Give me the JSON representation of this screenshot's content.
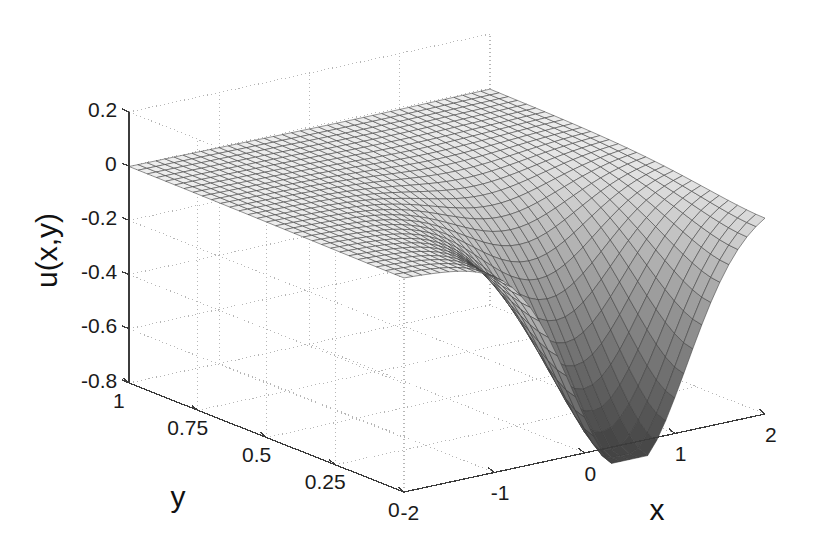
{
  "chart_data": {
    "type": "surface",
    "title": "",
    "xlabel": "x",
    "ylabel": "y",
    "zlabel": "u(x,y)",
    "xlim": [
      -2,
      2
    ],
    "ylim": [
      0,
      1
    ],
    "zlim": [
      -0.8,
      0.2
    ],
    "xticks": [
      "-2",
      "-1",
      "0",
      "1",
      "2"
    ],
    "xtick_values": [
      -2,
      -1,
      0,
      1,
      2
    ],
    "yticks": [
      "1",
      "0.75",
      "0.5",
      "0.25",
      "0"
    ],
    "ytick_values": [
      1,
      0.75,
      0.5,
      0.25,
      0
    ],
    "zticks": [
      "0.2",
      "0",
      "-0.2",
      "-0.4",
      "-0.6",
      "-0.8"
    ],
    "ztick_values": [
      0.2,
      0,
      -0.2,
      -0.4,
      -0.6,
      -0.8
    ],
    "grid": true,
    "legend": "none",
    "colormap": "gray",
    "shading": "faceted",
    "mesh_color": "#3c3c3c",
    "grid_color": "#b4b4b4",
    "axis_color": "#3c3c3c",
    "background": "#ffffff",
    "view_azimuth": -37.5,
    "view_elevation": 26,
    "nx": 41,
    "ny": 31,
    "surface_minimum": -0.85,
    "surface_maximum": 0.0,
    "well_center_x": 0.5,
    "well_center_y": 0.0,
    "well_depth": -0.85,
    "well_radius_x": 1.1,
    "well_decay_y": 0.32
  }
}
